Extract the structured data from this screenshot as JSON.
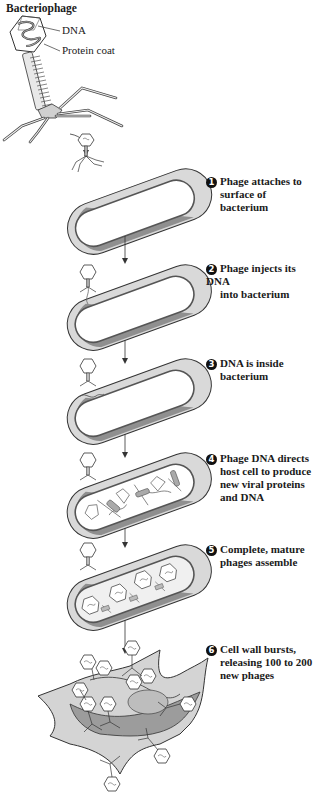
{
  "title": "Bacteriophage",
  "phage_labels": {
    "dna": "DNA",
    "protein_coat": "Protein coat"
  },
  "steps": [
    {
      "number": "1",
      "line1": "Phage attaches to",
      "rest": "surface of bacterium"
    },
    {
      "number": "2",
      "line1": "Phage injects its DNA",
      "rest": "into bacterium"
    },
    {
      "number": "3",
      "line1": "DNA is inside",
      "rest": "bacterium"
    },
    {
      "number": "4",
      "line1": "Phage DNA directs",
      "rest": "host cell to produce new viral proteins and DNA"
    },
    {
      "number": "5",
      "line1": "Complete, mature",
      "rest": "phages assemble"
    },
    {
      "number": "6",
      "line1": "Cell wall bursts,",
      "rest": "releasing 100 to 200 new phages"
    }
  ],
  "colors": {
    "cell_wall_light": "#d9d9d9",
    "cell_wall_dark": "#8f8f8f",
    "cell_interior": "#ffffff",
    "outline": "#333333",
    "text": "#1a1a1a"
  }
}
